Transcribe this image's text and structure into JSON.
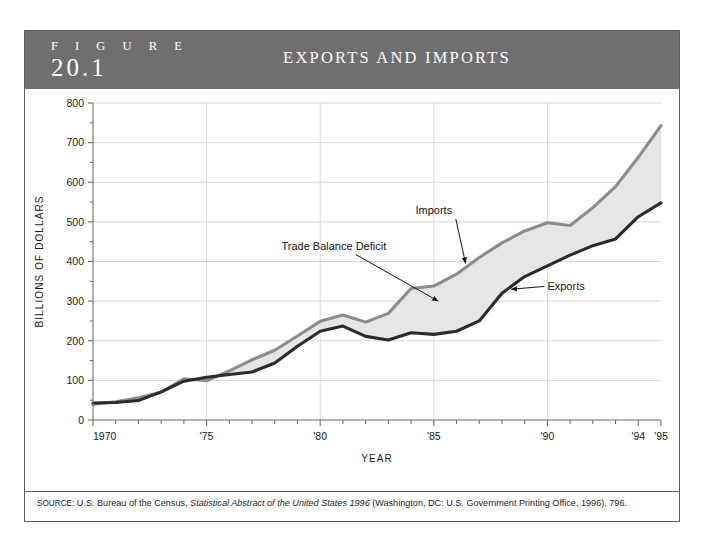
{
  "figure": {
    "label_word": "F I G U R E",
    "number": "20.1",
    "title": "EXPORTS AND IMPORTS"
  },
  "source": {
    "prefix": "SOURCE:",
    "part1": " U.S. Bureau of the Census, ",
    "italic": "Statistical Abstract of the United States 1996",
    "part2": " (Washington, DC: U.S. Government Printing Office, 1996), 796."
  },
  "colors": {
    "header_bg": "#6f6f6f",
    "frame": "#5e5e5e",
    "exports_line": "#2b2b2b",
    "imports_line": "#8c8c8c",
    "deficit_fill": "#e6e6e6",
    "gridline": "#d8d8d8",
    "axis": "#6b6b6b"
  },
  "chart_data": {
    "type": "area",
    "title": "EXPORTS AND IMPORTS",
    "xlabel": "YEAR",
    "ylabel": "BILLIONS OF DOLLARS",
    "xlim": [
      1970,
      1995
    ],
    "ylim": [
      0,
      800
    ],
    "yticks": [
      0,
      100,
      200,
      300,
      400,
      500,
      600,
      700,
      800
    ],
    "ytick_labels": [
      "0",
      "100",
      "200",
      "300",
      "400",
      "500",
      "600",
      "700",
      "800"
    ],
    "xticks": [
      1970,
      1975,
      1980,
      1985,
      1990,
      1994,
      1995
    ],
    "xtick_labels": [
      "1970",
      "'75",
      "'80",
      "'85",
      "'90",
      "'94",
      "'95"
    ],
    "grid": true,
    "legend_position": "inline-annotations",
    "x": [
      1970,
      1971,
      1972,
      1973,
      1974,
      1975,
      1976,
      1977,
      1978,
      1979,
      1980,
      1981,
      1982,
      1983,
      1984,
      1985,
      1986,
      1987,
      1988,
      1989,
      1990,
      1991,
      1992,
      1993,
      1994,
      1995
    ],
    "series": [
      {
        "name": "Exports",
        "values": [
          43,
          44,
          49,
          71,
          98,
          108,
          115,
          121,
          144,
          186,
          224,
          237,
          211,
          202,
          220,
          216,
          224,
          250,
          320,
          362,
          389,
          416,
          440,
          457,
          513,
          548
        ]
      },
      {
        "name": "Imports",
        "values": [
          40,
          46,
          56,
          70,
          104,
          99,
          124,
          152,
          176,
          212,
          249,
          265,
          247,
          269,
          332,
          338,
          368,
          410,
          447,
          477,
          498,
          491,
          536,
          589,
          663,
          743
        ]
      }
    ],
    "annotations": [
      {
        "text": "Imports",
        "label_x": 1985.0,
        "label_y": 520,
        "point_x": 1986.4,
        "point_y": 395
      },
      {
        "text": "Trade Balance Deficit",
        "label_x": 1980.6,
        "label_y": 430,
        "point_x": 1985.2,
        "point_y": 300
      },
      {
        "text": "Exports",
        "label_x": 1990.0,
        "label_y": 327,
        "point_x": 1988.4,
        "point_y": 330
      }
    ]
  }
}
